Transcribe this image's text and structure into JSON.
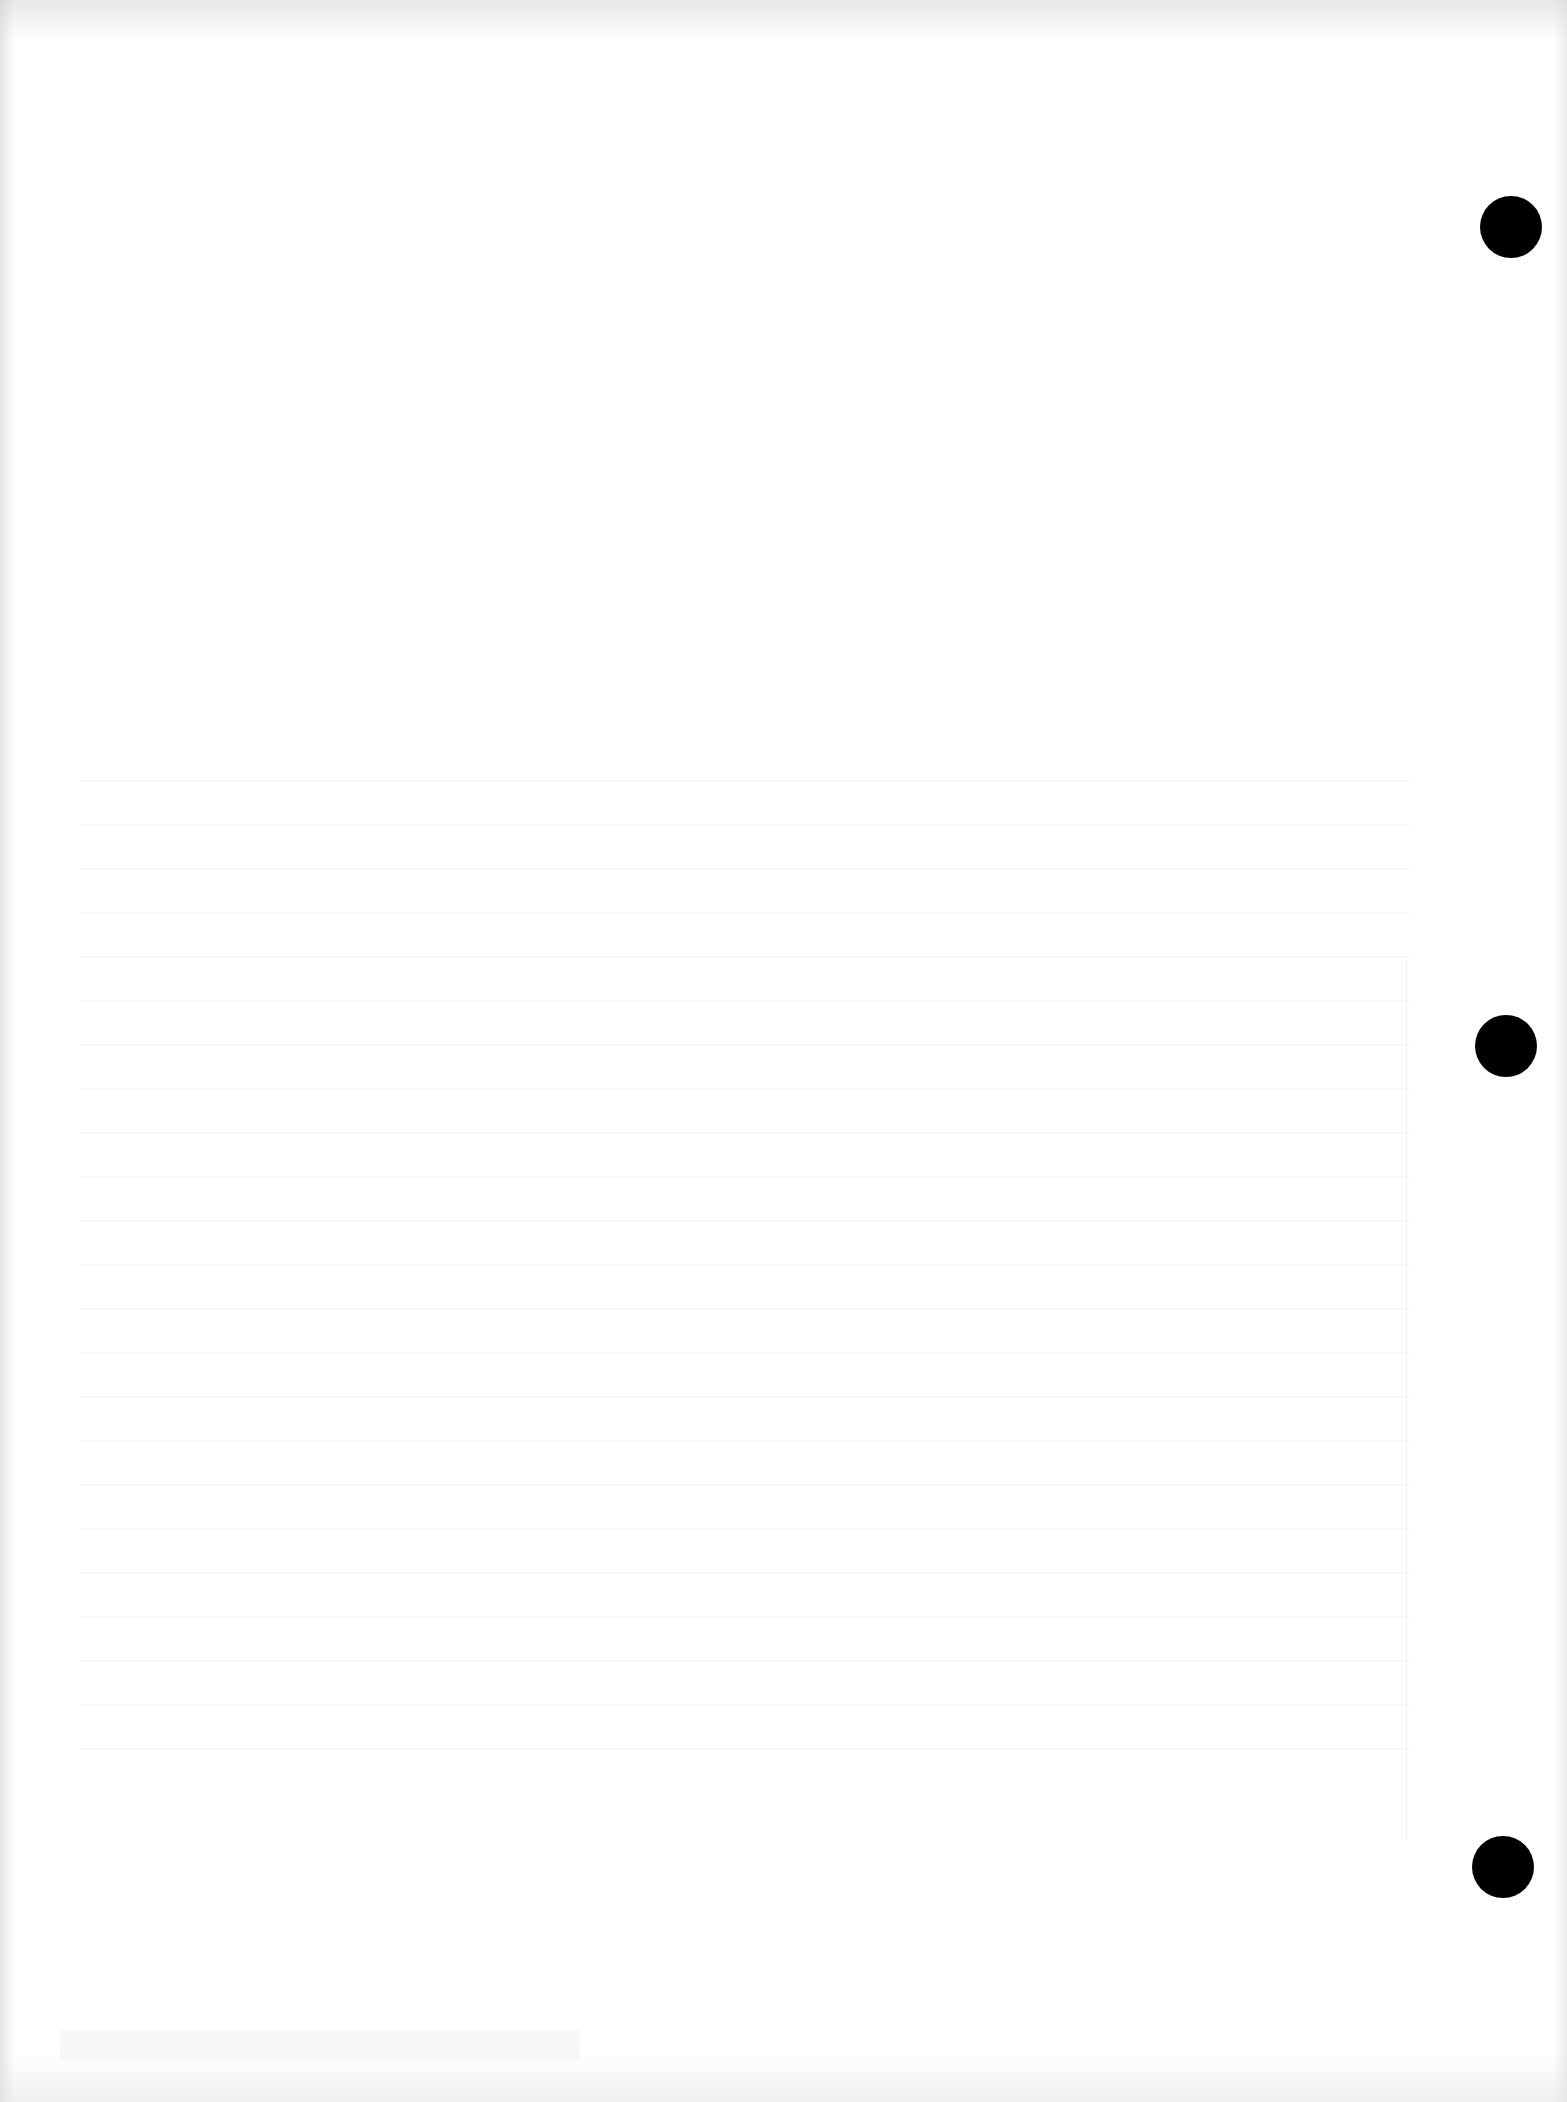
{
  "page": {
    "background_color": "#ffffff",
    "content": "blank scanned page (only illegible bleed-through from reverse side)"
  },
  "punch_holes": [
    {
      "label": "top",
      "center_x": 1511,
      "center_y": 227,
      "color": "#000000"
    },
    {
      "label": "middle",
      "center_x": 1506,
      "center_y": 1046,
      "color": "#000000"
    },
    {
      "label": "bottom",
      "center_x": 1503,
      "center_y": 1867,
      "color": "#000000"
    }
  ]
}
